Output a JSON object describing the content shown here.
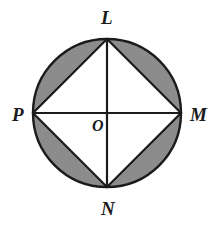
{
  "figure": {
    "background_color": "#ffffff",
    "stroke_color": "#1b1b1b",
    "shade_color": "#8c8c8c",
    "interior_fill": "#ffffff",
    "labels": {
      "top": "L",
      "right": "M",
      "bottom": "N",
      "left": "P",
      "center": "O"
    }
  },
  "chart_data": {
    "type": "diagram",
    "circle": {
      "center_x": 107,
      "center_y": 113,
      "radius": 74,
      "stroke_width": 2.4,
      "stroke": "#1b1b1b",
      "fill": "#8c8c8c"
    },
    "points": [
      {
        "name": "L",
        "x": 107,
        "y": 39,
        "position": "top",
        "label_offset_x": -6,
        "label_offset_y": -31
      },
      {
        "name": "M",
        "x": 181,
        "y": 113,
        "position": "right",
        "label_offset_x": 9,
        "label_offset_y": -8
      },
      {
        "name": "N",
        "x": 107,
        "y": 187,
        "position": "bottom",
        "label_offset_x": -6,
        "label_offset_y": 12
      },
      {
        "name": "P",
        "x": 33,
        "y": 113,
        "position": "left",
        "label_offset_x": -21,
        "label_offset_y": -8
      },
      {
        "name": "O",
        "x": 107,
        "y": 113,
        "position": "center",
        "label_offset_x": -15,
        "label_offset_y": 5
      }
    ],
    "square": {
      "vertices": [
        "L",
        "M",
        "N",
        "P"
      ],
      "path": "107,39 181,113 107,187 33,113",
      "fill": "#ffffff",
      "stroke": "#1b1b1b",
      "stroke_width": 2.2
    },
    "diameters": [
      {
        "name": "LN",
        "x1": 107,
        "y1": 39,
        "x2": 107,
        "y2": 187
      },
      {
        "name": "PM",
        "x1": 33,
        "y1": 113,
        "x2": 181,
        "y2": 113
      }
    ],
    "shaded_regions": [
      {
        "name": "segment-LP",
        "between_chord": "P-L",
        "arc": "minor arc from P to L",
        "shaded": true
      },
      {
        "name": "segment-LM",
        "between_chord": "L-M",
        "arc": "minor arc from L to M",
        "shaded": true
      },
      {
        "name": "segment-MN",
        "between_chord": "M-N",
        "arc": "minor arc from M to N",
        "shaded": true
      },
      {
        "name": "segment-NP",
        "between_chord": "N-P",
        "arc": "minor arc from N to P",
        "shaded": true
      }
    ]
  }
}
